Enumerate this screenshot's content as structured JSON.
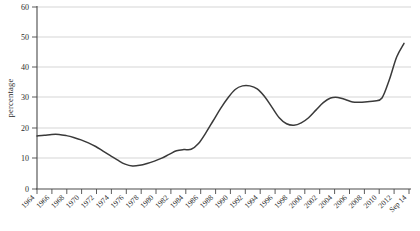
{
  "chart_data": {
    "type": "line",
    "title": "",
    "xlabel": "",
    "ylabel": "percentage",
    "ylim": [
      0,
      60
    ],
    "yticks": [
      0,
      10,
      20,
      30,
      40,
      50,
      60
    ],
    "grid": true,
    "legend": "none",
    "x_tick_labels": [
      "1964",
      "1966",
      "1968",
      "1970",
      "1972",
      "1974",
      "1976",
      "1978",
      "1980",
      "1982",
      "1984",
      "1986",
      "1988",
      "1990",
      "1992",
      "1994",
      "1996",
      "1998",
      "2000",
      "2002",
      "2004",
      "2006",
      "2008",
      "2010",
      "2012",
      "Sep 14"
    ],
    "series": [
      {
        "name": "percentage",
        "color": "#3a3a3a",
        "x": [
          "1964",
          "1965",
          "1966",
          "1967",
          "1968",
          "1969",
          "1970",
          "1971",
          "1972",
          "1973",
          "1974",
          "1975",
          "1976",
          "1977",
          "1978",
          "1979",
          "1980",
          "1981",
          "1982",
          "1983",
          "1984",
          "1985",
          "1986",
          "1987",
          "1988",
          "1989",
          "1990",
          "1991",
          "1992",
          "1993",
          "1994",
          "1995",
          "1996",
          "1997",
          "1998",
          "1999",
          "2000",
          "2001",
          "2002",
          "2003",
          "2004",
          "2005",
          "2006",
          "2007",
          "2008",
          "2009",
          "2010",
          "2011",
          "2012",
          "2013",
          "Sep 14"
        ],
        "values": [
          17.5,
          17.7,
          18.0,
          18.0,
          17.6,
          17.0,
          16.2,
          15.2,
          14.0,
          12.5,
          11.0,
          9.5,
          8.2,
          7.6,
          7.8,
          8.4,
          9.2,
          10.2,
          11.4,
          12.6,
          13.0,
          13.1,
          15.0,
          18.5,
          22.5,
          26.5,
          30.0,
          32.8,
          34.0,
          34.0,
          33.0,
          30.5,
          27.0,
          23.5,
          21.5,
          21.0,
          21.8,
          23.5,
          26.0,
          28.5,
          30.0,
          30.2,
          29.5,
          28.7,
          28.6,
          28.8,
          29.0,
          30.0,
          36.0,
          43.5,
          48.0
        ]
      }
    ],
    "series_dense_note": "smooth single curve"
  },
  "axis": {
    "y_label": "percentage",
    "y_ticks": [
      "60",
      "50",
      "40",
      "30",
      "20",
      "10",
      "0"
    ],
    "x_ticks": [
      "1964",
      "1966",
      "1968",
      "1970",
      "1972",
      "1974",
      "1976",
      "1978",
      "1980",
      "1982",
      "1984",
      "1986",
      "1988",
      "1990",
      "1992",
      "1994",
      "1996",
      "1998",
      "2000",
      "2002",
      "2004",
      "2006",
      "2008",
      "2010",
      "2012",
      "Sep 14"
    ]
  },
  "colors": {
    "line": "#3a3a3a",
    "grid": "#b9b9b9",
    "axis": "#4a4a4a",
    "text": "#2b2b2b",
    "background": "#ffffff"
  },
  "path": {
    "d": "M 37,135.5 C 42,135 46,134 50,133.5 C 54,133 58,133 62,133.5 C 66,134.5 70,136.5 74,139.5 C 78,142.5 82,146.5 86,150.5 C 90,154.5 94,158.5 98,161.5 C 102,164.5 106,166.8 110,168.5 C 113,169.8 116,170.5 119,170.3 C 122,170 125,169 128,167.5 C 131,166 134,164 137,161.8 C 140,159.5 143,157.2 146,155 C 149,153 152,151.5 155,150.8 C 158,150.2 161,150 164,149.8 C 166,149.6 168,148.5 170,145.5 C 173,141 176,135 179,128.5 C 182,122 185,115.5 188,109.5 C 191,104 194,99.5 197,96.5 C 200,93.8 203,92.5 206,92.5 C 209,92.5 212,92.6 215,93.5 C 218,94.5 221,96.5 224,100 C 227,104 230,109 233,114.5 C 236,120 239,124.8 242,128 C 245,130.8 248,132.2 251,132.5 C 254,132.5 257,131.8 260,130 C 263,127.8 266,124.5 269,120.5 C 272,116.5 275,112.5 278,109.5 C 281,107 284,105.5 287,105 C 290,104.8 293,105.2 296,106.5 C 299,107.8 302,108.8 305,108.8 C 308,108.7 311,108.5 314,108.3 C 317,108.2 320,108 323,107.8 C 326,107.5 329,105 332,99 C 335,92 338,82 341,70.5 C 344,60 347,51 350,45.5 C 353,41.5 356,39.5 359,38.5 C 362,38.2 365,40 368,42 C 371,43.5 374,44 377,43.5 C 380,43.2 383,45 386,50.5 C 389,57 392,66 395,73.5 C 398,79.5 401,83.5 404,85.5"
  }
}
